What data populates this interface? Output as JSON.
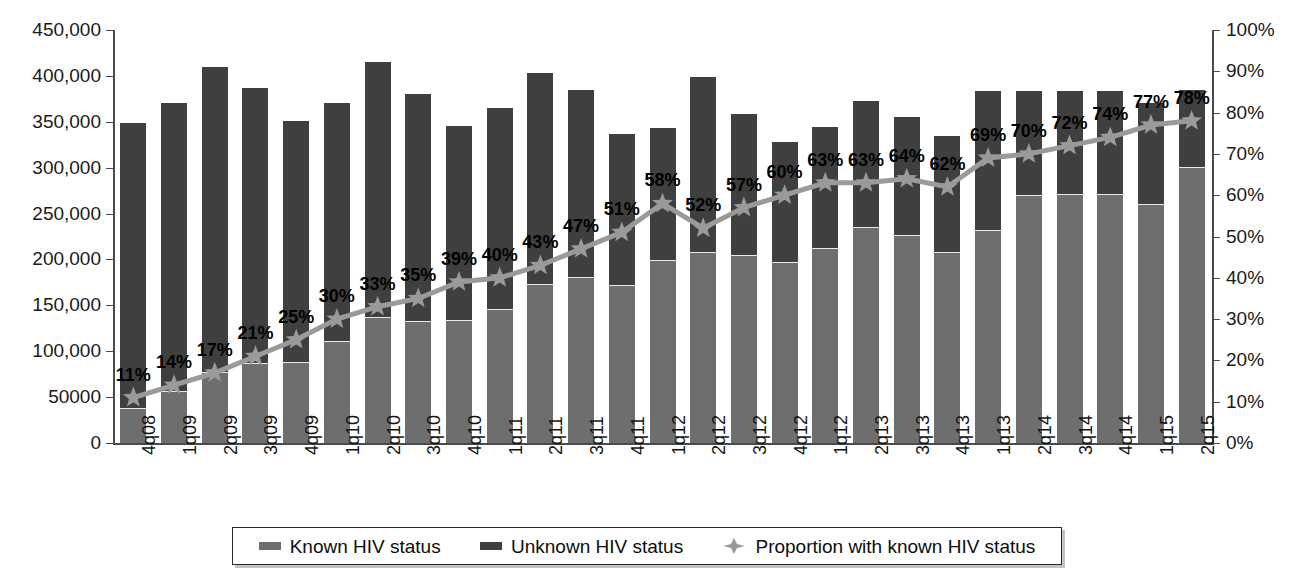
{
  "chart_data": {
    "type": "bar",
    "title": "",
    "subtitle": "",
    "xlabel": "",
    "ylabel": "",
    "y2label": "",
    "grid": false,
    "legend_position": "bottom",
    "ylim": [
      0,
      450000
    ],
    "y2lim": [
      0,
      100
    ],
    "ytick_labels": [
      "450,000",
      "400,000",
      "350,000",
      "300,000",
      "250,000",
      "200,000",
      "150,000",
      "100,000",
      "50000",
      "0"
    ],
    "ytick_values": [
      450000,
      400000,
      350000,
      300000,
      250000,
      200000,
      150000,
      100000,
      50000,
      0
    ],
    "y2tick_labels": [
      "100%",
      "90%",
      "80%",
      "70%",
      "60%",
      "50%",
      "40%",
      "30%",
      "20%",
      "10%",
      "0%"
    ],
    "y2tick_values": [
      100,
      90,
      80,
      70,
      60,
      50,
      40,
      30,
      20,
      10,
      0
    ],
    "categories": [
      "4q08",
      "1q09",
      "2q09",
      "3q09",
      "4q09",
      "1q10",
      "2q10",
      "3q10",
      "4q10",
      "1q11",
      "2q11",
      "3q11",
      "4q11",
      "1q12",
      "2q12",
      "3q12",
      "4q12",
      "1q12",
      "2q13",
      "3q13",
      "4q13",
      "1q13",
      "2q14",
      "3q14",
      "4q14",
      "1q15",
      "2q15"
    ],
    "series": [
      {
        "name": "Known HIV status",
        "axis": "left",
        "color": "#6e6e6e",
        "values": [
          38000,
          57000,
          77000,
          87000,
          88000,
          111000,
          137000,
          133000,
          134000,
          146000,
          173000,
          181000,
          172000,
          199000,
          208000,
          205000,
          197000,
          213000,
          235000,
          227000,
          208000,
          232000,
          270000,
          271000,
          271000,
          260000,
          301000
        ]
      },
      {
        "name": "Unknown HIV status",
        "axis": "left",
        "color": "#3f3f3f",
        "values": [
          311000,
          313000,
          333000,
          300000,
          263000,
          259000,
          278000,
          247000,
          211000,
          219000,
          230000,
          204000,
          165000,
          144000,
          191000,
          154000,
          131000,
          131000,
          138000,
          128000,
          127000,
          152000,
          114000,
          113000,
          113000,
          110000,
          84000
        ]
      },
      {
        "name": "Proportion with known HIV status",
        "axis": "right",
        "color": "#9a9a9a",
        "values": [
          11,
          14,
          17,
          21,
          25,
          30,
          33,
          35,
          39,
          40,
          43,
          47,
          51,
          58,
          52,
          57,
          60,
          63,
          63,
          64,
          62,
          69,
          70,
          72,
          74,
          77,
          78
        ]
      }
    ],
    "data_labels": [
      "11%",
      "14%",
      "17%",
      "21%",
      "25%",
      "30%",
      "33%",
      "35%",
      "39%",
      "40%",
      "43%",
      "47%",
      "51%",
      "58%",
      "52%",
      "57%",
      "60%",
      "63%",
      "63%",
      "64%",
      "62%",
      "69%",
      "70%",
      "72%",
      "74%",
      "77%",
      "78%"
    ]
  },
  "legend": {
    "items": [
      {
        "label": "Known HIV status",
        "marker": "square-swatch-icon"
      },
      {
        "label": "Unknown HIV status",
        "marker": "square-swatch-icon"
      },
      {
        "label": "Proportion with known HIV status",
        "marker": "star-marker-icon"
      }
    ]
  },
  "colors": {
    "known": "#6e6e6e",
    "unknown": "#3f3f3f",
    "line": "#9a9a9a",
    "axis": "#4a4a4a",
    "text": "#121212",
    "background": "#ffffff"
  }
}
